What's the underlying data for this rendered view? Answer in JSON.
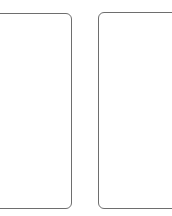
{
  "panels": [
    {
      "id": "left",
      "label": ""
    },
    {
      "id": "right",
      "label": ""
    }
  ],
  "colors": {
    "border": "#6e6e6e",
    "background": "#ffffff"
  }
}
